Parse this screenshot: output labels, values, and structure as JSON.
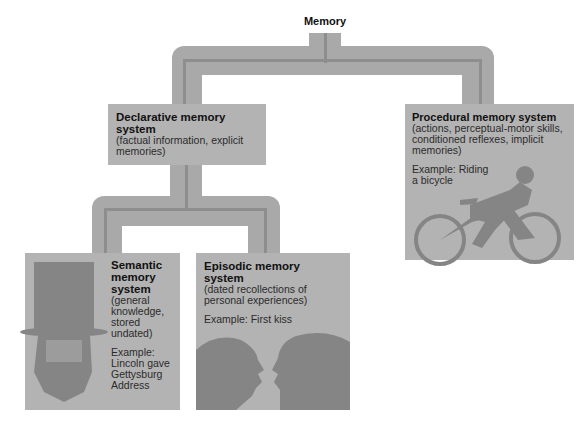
{
  "root": {
    "label": "Memory"
  },
  "declarative": {
    "title": "Declarative memory system",
    "description": "(factual information, explicit memories)"
  },
  "procedural": {
    "title": "Procedural memory system",
    "description": "(actions, perceptual-motor skills, conditioned reflexes, implicit memories)",
    "example": "Example: Riding a bicycle",
    "illustration": "cyclist-icon"
  },
  "semantic": {
    "title": "Semantic memory system",
    "description": "(general knowledge, stored undated)",
    "example": "Example: Lincoln gave Gettysburg Address",
    "illustration": "lincoln-portrait-icon"
  },
  "episodic": {
    "title": "Episodic memory system",
    "description": "(dated recollections of personal experiences)",
    "example": "Example: First kiss",
    "illustration": "kissing-couple-icon"
  },
  "colors": {
    "box": "#b3b3b3",
    "connector": "#a9a9a9",
    "connector_inner": "#8e8e8e",
    "illustration": "#8a8a8a"
  }
}
